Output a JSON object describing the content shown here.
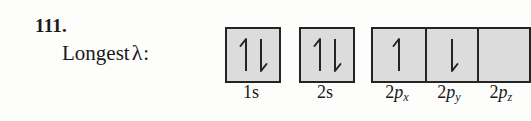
{
  "problem": {
    "number": "111.",
    "prompt_text": "Longest",
    "prompt_symbol": "λ",
    "prompt_colon": ":"
  },
  "diagram": {
    "type": "orbital-filling-diagram",
    "box_fill_color": "#dcdcdc",
    "box_border_color": "#242424",
    "groups": [
      {
        "name": "1s",
        "boxes": [
          {
            "label_prefix": "1",
            "label_letter": "s",
            "label_subscript": "",
            "label_text": "1s",
            "spins": [
              "up",
              "down"
            ],
            "electron_count": 2
          }
        ]
      },
      {
        "name": "2s",
        "boxes": [
          {
            "label_prefix": "2",
            "label_letter": "s",
            "label_subscript": "",
            "label_text": "2s",
            "spins": [
              "up",
              "down"
            ],
            "electron_count": 2
          }
        ]
      },
      {
        "name": "2p",
        "boxes": [
          {
            "label_prefix": "2",
            "label_letter": "p",
            "label_subscript": "x",
            "label_text": "2px",
            "spins": [
              "up"
            ],
            "electron_count": 1
          },
          {
            "label_prefix": "2",
            "label_letter": "p",
            "label_subscript": "y",
            "label_text": "2py",
            "spins": [
              "down"
            ],
            "electron_count": 1
          },
          {
            "label_prefix": "2",
            "label_letter": "p",
            "label_subscript": "z",
            "label_text": "2pz",
            "spins": [],
            "electron_count": 0
          }
        ]
      }
    ]
  }
}
